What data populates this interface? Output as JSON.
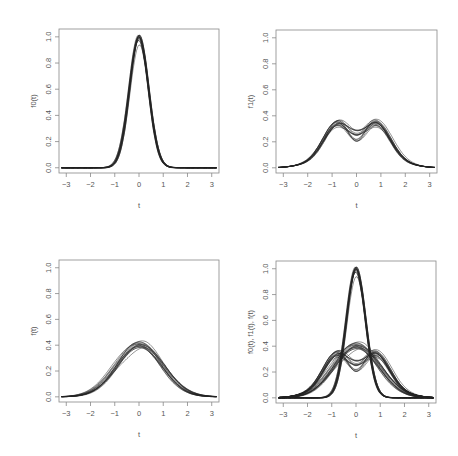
{
  "chart_data": [
    {
      "id": "f0",
      "type": "line",
      "title": "",
      "xlabel": "t",
      "ylabel": "f0(t)",
      "xlim": [
        -3.3,
        3.3
      ],
      "ylim": [
        -0.04,
        1.06
      ],
      "xticks": [
        -3,
        -2,
        -1,
        0,
        1,
        2,
        3
      ],
      "yticks": [
        0.0,
        0.2,
        0.4,
        0.6,
        0.8,
        1.0
      ],
      "ytick_labels": [
        "0.0",
        "0.2",
        "0.4",
        "0.6",
        "0.8",
        "1.0"
      ],
      "grid": false,
      "legend": "none",
      "box": {
        "x0": 59,
        "x1": 219,
        "y0": 29,
        "y1": 173
      },
      "series_description": "~15 overlapping Gaussian-like curves centered at t=0, peak 0.95-1.02, sd ~0.4",
      "family": {
        "kind": "gauss",
        "count": 15,
        "mu": 0.0,
        "sd": 0.4,
        "peak_min": 0.94,
        "peak_max": 1.02,
        "mu_jitter": 0.03
      }
    },
    {
      "id": "f1",
      "type": "line",
      "title": "",
      "xlabel": "t",
      "ylabel": "f1(t)",
      "xlim": [
        -3.3,
        3.3
      ],
      "ylim": [
        -0.04,
        1.06
      ],
      "xticks": [
        -3,
        -2,
        -1,
        0,
        1,
        2,
        3
      ],
      "yticks": [
        0.0,
        0.2,
        0.4,
        0.6,
        0.8,
        1.0
      ],
      "ytick_labels": [
        "0.0",
        "0.2",
        "0.4",
        "0.6",
        "0.8",
        "1.0"
      ],
      "grid": false,
      "legend": "none",
      "box": {
        "x0": 276,
        "x1": 437,
        "y0": 30,
        "y1": 173
      },
      "series_description": "~15 bimodal curves with modes near t=-0.7 and t=0.8 (~0.33), dip at t=0 (~0.2-0.3)",
      "family": {
        "kind": "bimodal",
        "count": 15,
        "m1": -0.75,
        "m2": 0.8,
        "sd": 0.6,
        "peak_min": 0.3,
        "peak_max": 0.36,
        "dip_min": 0.19,
        "dip_max": 0.3
      }
    },
    {
      "id": "f",
      "type": "line",
      "title": "",
      "xlabel": "t",
      "ylabel": "f(t)",
      "xlim": [
        -3.3,
        3.3
      ],
      "ylim": [
        -0.04,
        1.06
      ],
      "xticks": [
        -3,
        -2,
        -1,
        0,
        1,
        2,
        3
      ],
      "yticks": [
        0.0,
        0.2,
        0.4,
        0.6,
        0.8,
        1.0
      ],
      "ytick_labels": [
        "0.0",
        "0.2",
        "0.4",
        "0.6",
        "0.8",
        "1.0"
      ],
      "grid": false,
      "legend": "none",
      "box": {
        "x0": 59,
        "x1": 219,
        "y0": 260,
        "y1": 402
      },
      "series_description": "~15 unimodal curves centered near t=0 with peak 0.37-0.43, sd ~1",
      "family": {
        "kind": "gauss",
        "count": 15,
        "mu": 0.0,
        "sd": 0.95,
        "peak_min": 0.37,
        "peak_max": 0.43,
        "mu_jitter": 0.12
      }
    },
    {
      "id": "all",
      "type": "line",
      "title": "",
      "xlabel": "t",
      "ylabel": "f0(t), f1(t), f(t)",
      "xlim": [
        -3.3,
        3.3
      ],
      "ylim": [
        -0.04,
        1.06
      ],
      "xticks": [
        -3,
        -2,
        -1,
        0,
        1,
        2,
        3
      ],
      "yticks": [
        0.0,
        0.2,
        0.4,
        0.6,
        0.8,
        1.0
      ],
      "ytick_labels": [
        "0.0",
        "0.2",
        "0.4",
        "0.6",
        "0.8",
        "1.0"
      ],
      "grid": false,
      "legend": "none",
      "box": {
        "x0": 276,
        "x1": 436,
        "y0": 261,
        "y1": 403
      },
      "series_description": "Overlay of all three families: f0 (narrow peak ~1.0), f1 (bimodal ~0.33), f (unimodal ~0.4)",
      "overlay": [
        "f0",
        "f1",
        "f"
      ]
    }
  ],
  "style": {
    "line_color": "#222222",
    "line_alpha": 0.7,
    "axis_color": "#888888",
    "text_color": "#555555",
    "background": "#ffffff"
  }
}
